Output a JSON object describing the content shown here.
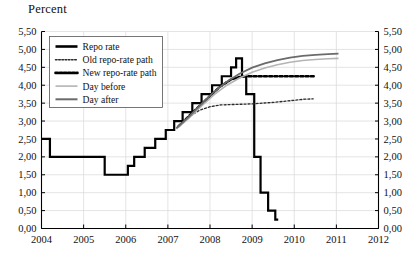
{
  "chart_data": {
    "type": "line",
    "title": "Percent",
    "xlabel": "",
    "ylabel": "Percent",
    "xlim": [
      2004,
      2012
    ],
    "ylim": [
      0.0,
      5.5
    ],
    "grid": true,
    "legend_position": "top-left-inside",
    "x_ticks": [
      "2004",
      "2005",
      "2006",
      "2007",
      "2008",
      "2009",
      "2010",
      "2011",
      "2012"
    ],
    "x_tick_values": [
      2004,
      2005,
      2006,
      2007,
      2008,
      2009,
      2010,
      2011,
      2012
    ],
    "y_ticks": [
      "0,00",
      "0,50",
      "1,00",
      "1,50",
      "2,00",
      "2,50",
      "3,00",
      "3,50",
      "4,00",
      "4,50",
      "5,00",
      "5,50"
    ],
    "y_tick_values": [
      0.0,
      0.5,
      1.0,
      1.5,
      2.0,
      2.5,
      3.0,
      3.5,
      4.0,
      4.5,
      5.0,
      5.5
    ],
    "y_axis_right": true,
    "decimal_separator": ",",
    "series": [
      {
        "name": "Repo rate",
        "style": "step",
        "color": "#000000",
        "width": 2.2,
        "dash": "none",
        "x": [
          2004.0,
          2004.2,
          2004.2,
          2005.5,
          2005.5,
          2006.05,
          2006.05,
          2006.2,
          2006.2,
          2006.45,
          2006.45,
          2006.7,
          2006.7,
          2006.95,
          2006.95,
          2007.15,
          2007.15,
          2007.35,
          2007.35,
          2007.58,
          2007.58,
          2007.8,
          2007.8,
          2008.05,
          2008.05,
          2008.28,
          2008.28,
          2008.5,
          2008.5,
          2008.62,
          2008.62,
          2008.76,
          2008.76,
          2008.86,
          2008.86,
          2009.05,
          2009.05,
          2009.2,
          2009.2,
          2009.38,
          2009.38,
          2009.55,
          2009.55,
          2009.62
        ],
        "y": [
          2.5,
          2.5,
          2.0,
          2.0,
          1.5,
          1.5,
          1.75,
          1.75,
          2.0,
          2.0,
          2.25,
          2.25,
          2.5,
          2.5,
          2.75,
          2.75,
          3.0,
          3.0,
          3.25,
          3.25,
          3.5,
          3.5,
          3.75,
          3.75,
          4.0,
          4.0,
          4.25,
          4.25,
          4.5,
          4.5,
          4.75,
          4.75,
          4.25,
          4.25,
          3.75,
          3.75,
          2.0,
          2.0,
          1.0,
          1.0,
          0.5,
          0.5,
          0.25,
          0.25
        ]
      },
      {
        "name": "Old repo-rate path",
        "style": "line",
        "color": "#2b2b2b",
        "width": 1.35,
        "dash": "2,2",
        "x": [
          2007.25,
          2007.5,
          2007.75,
          2008.0,
          2008.25,
          2008.5,
          2008.75,
          2009.0,
          2009.25,
          2009.5,
          2009.75,
          2010.0,
          2010.25,
          2010.45
        ],
        "y": [
          2.85,
          3.12,
          3.3,
          3.4,
          3.45,
          3.46,
          3.47,
          3.48,
          3.5,
          3.52,
          3.55,
          3.58,
          3.61,
          3.62
        ]
      },
      {
        "name": "New repo-rate path",
        "style": "line",
        "color": "#000000",
        "width": 2.4,
        "dash": "3,2.2",
        "x": [
          2007.25,
          2007.5,
          2007.75,
          2008.0,
          2008.25,
          2008.5,
          2008.7,
          2008.9,
          2009.1,
          2009.4,
          2009.7,
          2010.0,
          2010.3,
          2010.5
        ],
        "y": [
          2.85,
          3.14,
          3.42,
          3.7,
          3.97,
          4.16,
          4.23,
          4.25,
          4.25,
          4.25,
          4.25,
          4.25,
          4.25,
          4.25
        ]
      },
      {
        "name": "Day before",
        "style": "line",
        "color": "#b4b4b4",
        "width": 1.6,
        "dash": "none",
        "x": [
          2007.2,
          2007.5,
          2007.8,
          2008.1,
          2008.4,
          2008.7,
          2009.0,
          2009.3,
          2009.6,
          2009.9,
          2010.2,
          2010.5,
          2010.8,
          2011.05
        ],
        "y": [
          2.78,
          3.08,
          3.42,
          3.74,
          4.0,
          4.2,
          4.36,
          4.48,
          4.57,
          4.64,
          4.69,
          4.72,
          4.74,
          4.75
        ]
      },
      {
        "name": "Day after",
        "style": "line",
        "color": "#6b6b6b",
        "width": 1.8,
        "dash": "none",
        "x": [
          2007.2,
          2007.5,
          2007.8,
          2008.1,
          2008.4,
          2008.7,
          2009.0,
          2009.3,
          2009.6,
          2009.9,
          2010.2,
          2010.5,
          2010.8,
          2011.05
        ],
        "y": [
          2.8,
          3.12,
          3.48,
          3.82,
          4.1,
          4.32,
          4.49,
          4.61,
          4.7,
          4.77,
          4.82,
          4.85,
          4.87,
          4.88
        ]
      }
    ],
    "legend": [
      {
        "label": "Repo rate",
        "color": "#000000",
        "dash": "none",
        "width": 2.6
      },
      {
        "label": "Old repo-rate path",
        "color": "#2b2b2b",
        "dash": "1.6,1.6",
        "width": 1.5
      },
      {
        "label": "New repo-rate path",
        "color": "#000000",
        "dash": "2.4,1.8",
        "width": 2.6
      },
      {
        "label": "Day before",
        "color": "#b4b4b4",
        "dash": "none",
        "width": 1.6
      },
      {
        "label": "Day after",
        "color": "#6b6b6b",
        "dash": "none",
        "width": 2.0
      }
    ]
  }
}
